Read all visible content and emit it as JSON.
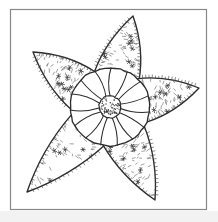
{
  "page": {
    "kind": "coloring-page-line-art",
    "background_color": "#ffffff",
    "ink_color": "#2b2b2b",
    "texture_color": "#555555",
    "frame": {
      "stroke_color": "#888888",
      "x": 10,
      "y": 9,
      "width": 197,
      "height": 201,
      "stroke_width": 1.2
    },
    "bottom_band": {
      "color": "#f2f2f2",
      "y": 211,
      "height": 11
    }
  },
  "figure": {
    "title": "Starfish line drawing",
    "center": {
      "x": 110,
      "y": 107
    },
    "disc": {
      "radius_x": 40,
      "radius_y": 39,
      "stroke_width": 1.3,
      "segment_count": 15,
      "hub": {
        "radius": 11,
        "stipple_dot_count": 46,
        "stroke_width": 1.2
      }
    },
    "arms": [
      {
        "name": "arm-top",
        "tip_x": 133,
        "tip_y": 16,
        "angle_deg": -78
      },
      {
        "name": "arm-upper-left",
        "tip_x": 33,
        "tip_y": 52,
        "angle_deg": -148
      },
      {
        "name": "arm-right",
        "tip_x": 199,
        "tip_y": 88,
        "angle_deg": -12
      },
      {
        "name": "arm-lower-left",
        "tip_x": 27,
        "tip_y": 192,
        "angle_deg": 133
      },
      {
        "name": "arm-lower-right",
        "tip_x": 155,
        "tip_y": 200,
        "angle_deg": 65
      }
    ],
    "arm_texture": {
      "tick_marks": true,
      "star_marks": true,
      "edge_spines": true
    }
  }
}
